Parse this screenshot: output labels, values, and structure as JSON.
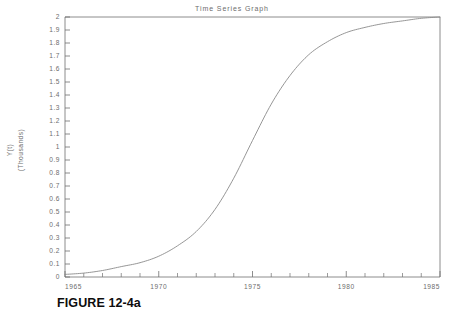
{
  "figure": {
    "caption": "FIGURE 12-4a"
  },
  "chart_data": {
    "type": "line",
    "title": "Time Series Graph",
    "xlabel": "",
    "ylabel": "Y(t)",
    "ylabel_units": "(Thousands)",
    "xlim": [
      1965,
      1985
    ],
    "ylim": [
      0,
      2
    ],
    "grid": false,
    "legend": "none",
    "x_tick_labels": [
      "1965",
      "1970",
      "1975",
      "1980",
      "1985"
    ],
    "x_tick_values": [
      1965,
      1970,
      1975,
      1980,
      1985
    ],
    "x_minor_tick_interval": 1,
    "y_tick_labels": [
      "0",
      "0.1",
      "0.2",
      "0.3",
      "0.4",
      "0.5",
      "0.6",
      "0.7",
      "0.8",
      "0.9",
      "1",
      "1.1",
      "1.2",
      "1.3",
      "1.4",
      "1.5",
      "1.6",
      "1.7",
      "1.8",
      "1.9",
      "2"
    ],
    "y_tick_values": [
      0,
      0.1,
      0.2,
      0.3,
      0.4,
      0.5,
      0.6,
      0.7,
      0.8,
      0.9,
      1.0,
      1.1,
      1.2,
      1.3,
      1.4,
      1.5,
      1.6,
      1.7,
      1.8,
      1.9,
      2.0
    ],
    "series": [
      {
        "name": "Y(t)",
        "color": "#8a8a8a",
        "x": [
          1965,
          1966,
          1967,
          1968,
          1969,
          1970,
          1971,
          1972,
          1973,
          1974,
          1975,
          1976,
          1977,
          1978,
          1979,
          1980,
          1981,
          1982,
          1983,
          1984,
          1985
        ],
        "values": [
          0.02,
          0.03,
          0.05,
          0.08,
          0.11,
          0.16,
          0.24,
          0.35,
          0.52,
          0.76,
          1.05,
          1.33,
          1.55,
          1.71,
          1.81,
          1.88,
          1.92,
          1.95,
          1.97,
          1.99,
          2.0
        ]
      }
    ]
  },
  "colors": {
    "axis": "#707070",
    "curve": "#8a8a8a",
    "text": "#6d6d6d",
    "caption": "#0d0d0d",
    "background": "#ffffff"
  }
}
